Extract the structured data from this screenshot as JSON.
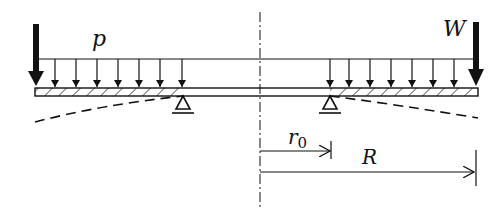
{
  "diagram": {
    "type": "annular plate with distributed load and edge load",
    "labels": {
      "distributed_load": "p",
      "edge_load": "W",
      "inner_radius": "r",
      "inner_radius_subscript": "0",
      "outer_radius": "R"
    },
    "colors": {
      "ink": "#111111",
      "background": "#ffffff"
    }
  }
}
